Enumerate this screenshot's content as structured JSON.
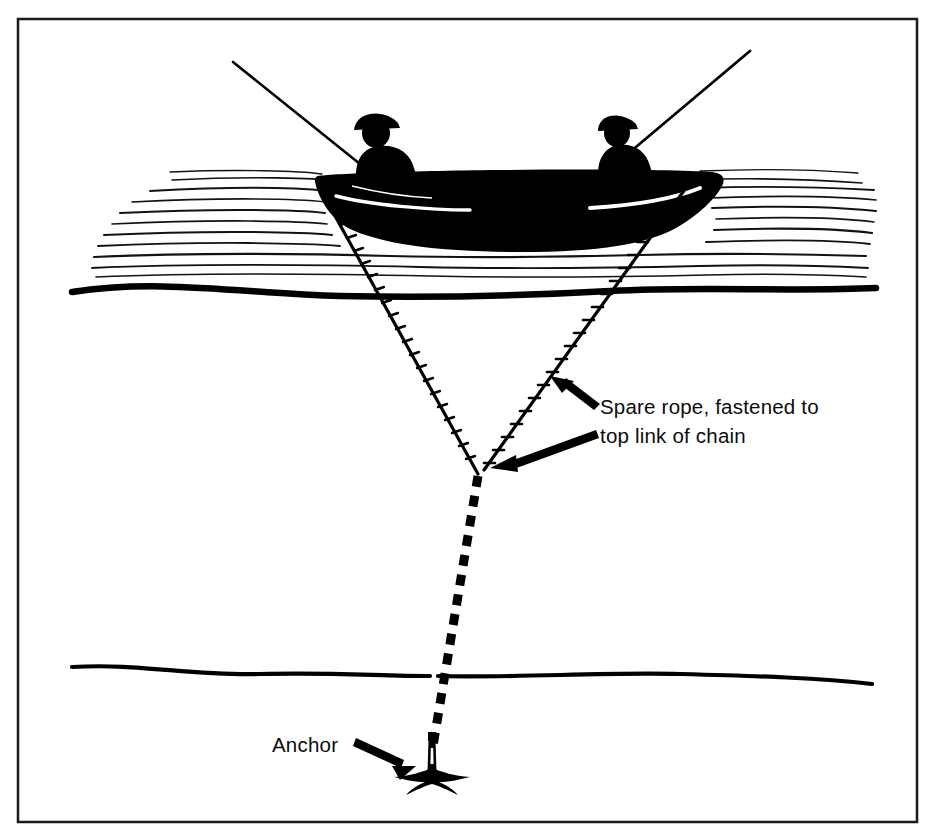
{
  "figure": {
    "domain_kind": "line-art-diagram",
    "background_color": "#ffffff",
    "ink_color": "#000000",
    "border": {
      "name": "figure-frame",
      "x": 18,
      "y": 19,
      "width": 899,
      "height": 803,
      "stroke_color": "#1a1a1a",
      "stroke_width": 2.5
    }
  },
  "labels": [
    {
      "id": "spare-rope-label",
      "lines": [
        "Spare rope, fastened to",
        "top link of chain"
      ],
      "x": 600,
      "y": 414,
      "line_height": 29
    },
    {
      "id": "anchor-label",
      "lines": [
        "Anchor"
      ],
      "x": 272,
      "y": 752,
      "line_height": 29
    }
  ],
  "scene": {
    "water": {
      "name": "water-surface",
      "hatch_line_count": 16,
      "hatch_top": 176,
      "hatch_bottom": 278,
      "hatch_left": 88,
      "hatch_right": 876,
      "waterline_y": 290,
      "waterline_stroke": 6
    },
    "seabed": {
      "name": "seabed-line",
      "y": 670,
      "left": 70,
      "right": 872,
      "stroke": 4
    },
    "boat": {
      "name": "rowboat-silhouette",
      "fill": "#000000",
      "bow_x": 710,
      "stern_x": 318,
      "gunwale_y": 172,
      "hull_bottom_y": 248
    },
    "anglers": [
      {
        "id": "angler-left",
        "x": 372,
        "hat": true
      },
      {
        "id": "angler-right",
        "x": 612,
        "hat": true
      }
    ],
    "rods": [
      {
        "id": "fishing-rod-left",
        "tip_x": 233,
        "tip_y": 62,
        "butt_x": 358,
        "butt_y": 163
      },
      {
        "id": "fishing-rod-right",
        "tip_x": 748,
        "tip_y": 52,
        "butt_x": 632,
        "butt_y": 152
      }
    ],
    "ropes": [
      {
        "id": "anchor-rope-left",
        "label": "anchor rope from stern",
        "top_x": 324,
        "top_y": 196,
        "bottom_x": 478,
        "bottom_y": 474,
        "texture": "twisted-hatch"
      },
      {
        "id": "spare-rope-right",
        "label": "spare rope from bow",
        "top_x": 693,
        "top_y": 178,
        "bottom_x": 484,
        "bottom_y": 470,
        "texture": "twisted-hatch"
      }
    ],
    "chain": {
      "id": "anchor-chain",
      "top_x": 478,
      "top_y": 476,
      "bottom_x": 432,
      "bottom_y": 756,
      "style": "dashed-links",
      "dash_length": 11,
      "dash_gap": 9,
      "stroke": 9
    },
    "anchor": {
      "id": "anchor-grapnel",
      "x": 432,
      "y": 768,
      "fill": "#000000"
    },
    "arrows": [
      {
        "id": "arrow-to-spare-rope",
        "from_x": 600,
        "from_y": 412,
        "to_x": 552,
        "to_y": 378,
        "points_at": "spare-rope-right"
      },
      {
        "id": "arrow-to-chain-junction",
        "from_x": 598,
        "from_y": 434,
        "to_x": 492,
        "to_y": 470,
        "points_at": "rope-chain-junction"
      },
      {
        "id": "arrow-to-anchor",
        "from_x": 358,
        "from_y": 742,
        "to_x": 412,
        "to_y": 768,
        "points_at": "anchor-grapnel"
      }
    ]
  }
}
